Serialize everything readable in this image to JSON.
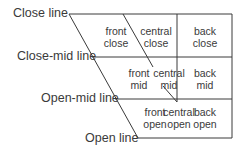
{
  "line_labels": {
    "close": "Close line",
    "close_mid": "Close-mid line",
    "open_mid": "Open-mid line",
    "open": "Open line"
  },
  "cells": {
    "close": [
      {
        "top": "front",
        "bottom": "close"
      },
      {
        "top": "central",
        "bottom": "close"
      },
      {
        "top": "back",
        "bottom": "close"
      }
    ],
    "mid": [
      {
        "top": "front",
        "bottom": "mid"
      },
      {
        "top": "central",
        "bottom": "mid"
      },
      {
        "top": "back",
        "bottom": "mid"
      }
    ],
    "open": [
      {
        "top": "front",
        "bottom": "open"
      },
      {
        "top": "central",
        "bottom": "open"
      },
      {
        "top": "back",
        "bottom": "open"
      }
    ]
  },
  "colors": {
    "line": "#3a3a3a",
    "text": "#3a3a3a"
  }
}
